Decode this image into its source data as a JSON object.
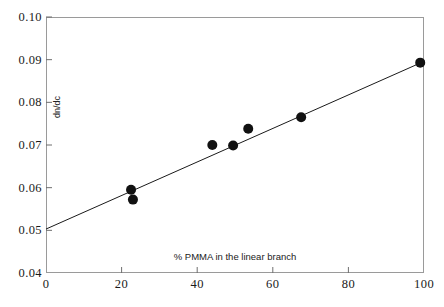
{
  "chart_data": {
    "type": "scatter",
    "title": "",
    "xlabel": "% PMMA in the linear branch",
    "ylabel": "dn/dc",
    "xlim": [
      0,
      100
    ],
    "ylim": [
      0.04,
      0.1
    ],
    "grid": false,
    "legend": null,
    "x_ticks": [
      0,
      20,
      40,
      60,
      80,
      100
    ],
    "x_tick_labels": [
      "0",
      "20",
      "40",
      "60",
      "80",
      "100"
    ],
    "y_ticks": [
      0.04,
      0.05,
      0.06,
      0.07,
      0.08,
      0.09,
      0.1
    ],
    "y_tick_labels": [
      "0.04",
      "0.05",
      "0.06",
      "0.07",
      "0.08",
      "0.09",
      "0.10"
    ],
    "series": [
      {
        "name": "dn/dc measurements",
        "type": "scatter",
        "marker": "filled-circle",
        "color": "#111111",
        "points": [
          {
            "x": 22.5,
            "y": 0.0595
          },
          {
            "x": 23.0,
            "y": 0.0572
          },
          {
            "x": 44.0,
            "y": 0.07
          },
          {
            "x": 49.5,
            "y": 0.0699
          },
          {
            "x": 53.5,
            "y": 0.0738
          },
          {
            "x": 67.5,
            "y": 0.0765
          },
          {
            "x": 99.0,
            "y": 0.0893
          }
        ]
      },
      {
        "name": "linear fit",
        "type": "line",
        "color": "#1a1a1a",
        "points": [
          {
            "x": 0.0,
            "y": 0.0503
          },
          {
            "x": 100.0,
            "y": 0.0896
          }
        ]
      }
    ]
  },
  "axes": {
    "y_title": "dn/dc",
    "x_title": "% PMMA in the linear branch"
  }
}
